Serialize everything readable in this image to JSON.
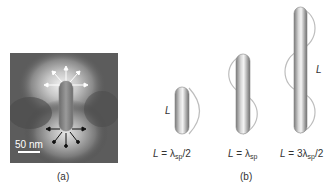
{
  "figure": {
    "panel_a": {
      "caption": "(a)",
      "scale_bar_label": "50 nm",
      "description": "Near-field map of nanorod with dipolar field arrows"
    },
    "panel_b": {
      "caption": "(b)",
      "rod_label": "L",
      "rods": [
        {
          "equation_prefix": "L",
          "equation": "= λ",
          "sub": "sp",
          "suffix": "/2"
        },
        {
          "equation_prefix": "L",
          "equation": "= λ",
          "sub": "sp",
          "suffix": ""
        },
        {
          "equation_prefix": "L",
          "equation": "= 3λ",
          "sub": "sp",
          "suffix": "/2"
        }
      ]
    }
  }
}
